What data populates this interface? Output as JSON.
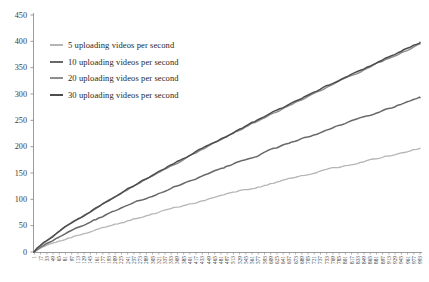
{
  "figure": {
    "background": "#ffffff",
    "axis_color": "#9b9b9b",
    "tick_label_color": "#3a3a3a"
  },
  "legend": {
    "items": [
      {
        "label": "5 uploading videos per second",
        "color": "#b5b5b5"
      },
      {
        "label": "10 uploading videos per second",
        "color": "#686868"
      },
      {
        "label": "20 uploading videos per second",
        "color": "#8d8d8d"
      },
      {
        "label": "30 uploading videos per second",
        "color": "#4d4d4d"
      }
    ]
  },
  "chart_data": {
    "type": "line",
    "title": "",
    "xlabel": "",
    "ylabel": "",
    "grid": false,
    "legend_position": "upper-left-inside",
    "xlim": [
      0,
      993
    ],
    "ylim": [
      0,
      450
    ],
    "y_ticks": [
      0,
      50,
      100,
      150,
      200,
      250,
      300,
      350,
      400,
      450
    ],
    "x_tick_labels": [
      1,
      17,
      33,
      49,
      65,
      81,
      97,
      113,
      129,
      145,
      161,
      177,
      193,
      209,
      225,
      241,
      257,
      273,
      289,
      305,
      321,
      337,
      353,
      369,
      385,
      401,
      417,
      433,
      449,
      465,
      481,
      497,
      513,
      529,
      545,
      561,
      577,
      593,
      609,
      625,
      641,
      657,
      673,
      689,
      705,
      721,
      737,
      753,
      769,
      785,
      801,
      817,
      833,
      849,
      865,
      881,
      897,
      913,
      929,
      945,
      961,
      977,
      993
    ],
    "x_checkpoints": [
      0,
      100,
      200,
      300,
      400,
      500,
      600,
      700,
      800,
      900,
      993
    ],
    "series": [
      {
        "name": "5 uploading videos per second",
        "color": "#b5b5b5",
        "stroke_width": 1.3,
        "end_value": 197,
        "curve_exponent": 0.85,
        "approx_values": [
          0,
          28,
          50,
          71,
          91,
          110,
          128,
          146,
          164,
          181,
          197
        ]
      },
      {
        "name": "10 uploading videos per second",
        "color": "#686868",
        "stroke_width": 1.5,
        "end_value": 293,
        "curve_exponent": 0.85,
        "approx_values": [
          0,
          42,
          75,
          106,
          135,
          163,
          191,
          218,
          244,
          270,
          293
        ]
      },
      {
        "name": "20 uploading videos per second",
        "color": "#8d8d8d",
        "stroke_width": 1.4,
        "end_value": 395,
        "curve_exponent": 0.85,
        "approx_values": [
          0,
          56,
          101,
          143,
          182,
          220,
          257,
          293,
          329,
          363,
          395
        ]
      },
      {
        "name": "30 uploading videos per second",
        "color": "#4d4d4d",
        "stroke_width": 1.5,
        "end_value": 398,
        "curve_exponent": 0.85,
        "approx_values": [
          0,
          57,
          102,
          144,
          184,
          222,
          259,
          296,
          331,
          366,
          398
        ]
      }
    ]
  }
}
